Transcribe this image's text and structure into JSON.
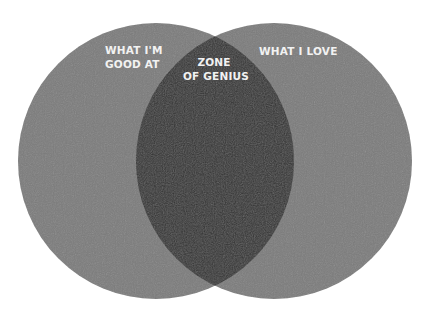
{
  "diagram": {
    "type": "venn",
    "sets": [
      {
        "id": "left",
        "label_lines": [
          "WHAT I'M",
          "GOOD AT"
        ]
      },
      {
        "id": "right",
        "label_lines": [
          "WHAT I LOVE"
        ]
      }
    ],
    "intersection": {
      "label_lines": [
        "ZONE",
        "OF GENIUS"
      ]
    },
    "colors": {
      "background": "#ffffff",
      "circle": "#7b7b7b",
      "overlap": "#343434",
      "text": "#f2f2f2"
    }
  }
}
